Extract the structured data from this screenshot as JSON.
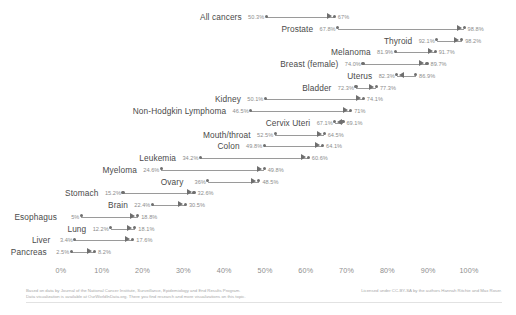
{
  "chart_data": {
    "type": "bar",
    "subtype": "arrow-plot",
    "title": "",
    "xlabel": "",
    "ylabel": "",
    "xlim": [
      0,
      100
    ],
    "xticks": [
      "0%",
      "10%",
      "20%",
      "30%",
      "40%",
      "50%",
      "60%",
      "70%",
      "80%",
      "90%",
      "100%"
    ],
    "xtick_values": [
      0,
      10,
      20,
      30,
      40,
      50,
      60,
      70,
      80,
      90,
      100
    ],
    "grid": false,
    "legend": "none",
    "series": [
      {
        "name": "start",
        "label_suffix": "%"
      },
      {
        "name": "end",
        "label_suffix": "%"
      }
    ],
    "categories": [
      "All cancers",
      "Prostate",
      "Thyroid",
      "Melanoma",
      "Breast (female)",
      "Uterus",
      "Bladder",
      "Kidney",
      "Non-Hodgkin Lymphoma",
      "Cervix Uteri",
      "Mouth/throat",
      "Colon",
      "Leukemia",
      "Myeloma",
      "Ovary",
      "Stomach",
      "Brain",
      "Esophagus",
      "Lung",
      "Liver",
      "Pancreas"
    ],
    "rows": [
      {
        "category": "All cancers",
        "start": 50.3,
        "end": 67.0,
        "start_label": "50.3%",
        "end_label": "67%",
        "direction": "right"
      },
      {
        "category": "Prostate",
        "start": 67.8,
        "end": 98.8,
        "start_label": "67.8%",
        "end_label": "98.8%",
        "direction": "right"
      },
      {
        "category": "Thyroid",
        "start": 92.1,
        "end": 98.2,
        "start_label": "92.1%",
        "end_label": "98.2%",
        "direction": "right"
      },
      {
        "category": "Melanoma",
        "start": 81.9,
        "end": 91.7,
        "start_label": "81.9%",
        "end_label": "91.7%",
        "direction": "right"
      },
      {
        "category": "Breast (female)",
        "start": 74.0,
        "end": 89.7,
        "start_label": "74.0%",
        "end_label": "89.7%",
        "direction": "right"
      },
      {
        "category": "Uterus",
        "start": 82.3,
        "end": 86.9,
        "start_label": "82.3%",
        "end_label": "86.9%",
        "direction": "left"
      },
      {
        "category": "Bladder",
        "start": 72.3,
        "end": 77.3,
        "start_label": "72.3%",
        "end_label": "77.3%",
        "direction": "right"
      },
      {
        "category": "Kidney",
        "start": 50.1,
        "end": 74.1,
        "start_label": "50.1%",
        "end_label": "74.1%",
        "direction": "right"
      },
      {
        "category": "Non-Hodgkin Lymphoma",
        "start": 46.5,
        "end": 71.0,
        "start_label": "46.5%",
        "end_label": "71%",
        "direction": "right"
      },
      {
        "category": "Cervix Uteri",
        "start": 67.1,
        "end": 69.1,
        "start_label": "67.1%",
        "end_label": "69.1%",
        "direction": "left"
      },
      {
        "category": "Mouth/throat",
        "start": 52.5,
        "end": 64.5,
        "start_label": "52.5%",
        "end_label": "64.5%",
        "direction": "right"
      },
      {
        "category": "Colon",
        "start": 49.8,
        "end": 64.1,
        "start_label": "49.8%",
        "end_label": "64.1%",
        "direction": "right"
      },
      {
        "category": "Leukemia",
        "start": 34.2,
        "end": 60.6,
        "start_label": "34.2%",
        "end_label": "60.6%",
        "direction": "right"
      },
      {
        "category": "Myeloma",
        "start": 24.6,
        "end": 49.8,
        "start_label": "24.6%",
        "end_label": "49.8%",
        "direction": "right"
      },
      {
        "category": "Ovary",
        "start": 36.0,
        "end": 48.5,
        "start_label": "36%",
        "end_label": "48.5%",
        "direction": "right"
      },
      {
        "category": "Stomach",
        "start": 15.2,
        "end": 32.6,
        "start_label": "15.2%",
        "end_label": "32.6%",
        "direction": "right"
      },
      {
        "category": "Brain",
        "start": 22.4,
        "end": 30.5,
        "start_label": "22.4%",
        "end_label": "30.5%",
        "direction": "right"
      },
      {
        "category": "Esophagus",
        "start": 5.0,
        "end": 18.8,
        "start_label": "5%",
        "end_label": "18.8%",
        "direction": "right"
      },
      {
        "category": "Lung",
        "start": 12.2,
        "end": 18.1,
        "start_label": "12.2%",
        "end_label": "18.1%",
        "direction": "right"
      },
      {
        "category": "Liver",
        "start": 3.4,
        "end": 17.6,
        "start_label": "3.4%",
        "end_label": "17.6%",
        "direction": "right"
      },
      {
        "category": "Pancreas",
        "start": 2.5,
        "end": 8.2,
        "start_label": "2.5%",
        "end_label": "8.2%",
        "direction": "right"
      }
    ]
  },
  "footer": {
    "source_line_1": "Based on data by Journal of the National Cancer Institute, Surveillance, Epidemiology and End Results Program.",
    "source_line_2": "Data visualization is available at OurWorldInData.org. There you find research and more visualizations on this topic.",
    "license": "Licensed under CC-BY-SA by the authors Hannah Ritchie and Max Roser."
  }
}
